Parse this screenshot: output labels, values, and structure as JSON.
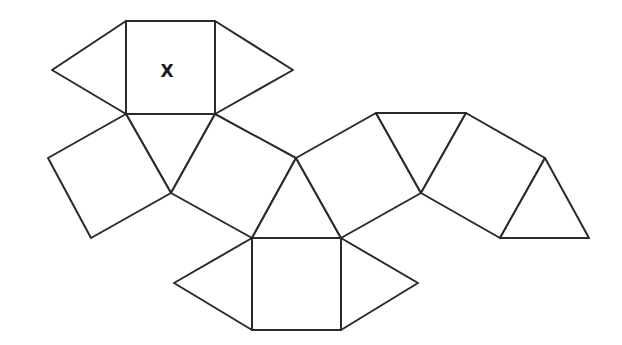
{
  "diagram": {
    "type": "polyhedron-net",
    "stroke_color": "#2a2a2a",
    "background": "#ffffff",
    "label": {
      "text": "X",
      "x": 167,
      "y": 77,
      "face": "top-square"
    },
    "faces": [
      {
        "id": "top-square",
        "shape": "square",
        "points": "126,21 215,21 215,114 126,114"
      },
      {
        "id": "top-left-triangle",
        "shape": "triangle",
        "points": "126,21 52,70 126,114"
      },
      {
        "id": "top-right-triangle",
        "shape": "triangle",
        "points": "215,21 293,70 215,114"
      },
      {
        "id": "upper-center-triangle",
        "shape": "triangle",
        "points": "126,114 215,114 171,193"
      },
      {
        "id": "left-square",
        "shape": "square",
        "points": "126,114 48,158 91,238 171,193"
      },
      {
        "id": "center-square",
        "shape": "square",
        "points": "215,114 296,158 252,238 171,193"
      },
      {
        "id": "middle-triangle",
        "shape": "triangle",
        "points": "296,158 341,238 252,238"
      },
      {
        "id": "bottom-square",
        "shape": "square",
        "points": "252,238 341,238 341,330 252,330"
      },
      {
        "id": "bottom-left-triangle",
        "shape": "triangle",
        "points": "252,238 174,283 252,330"
      },
      {
        "id": "bottom-right-triangle",
        "shape": "triangle",
        "points": "341,238 418,283 341,330"
      },
      {
        "id": "right-square-1",
        "shape": "square",
        "points": "296,158 376,113 421,193 341,238"
      },
      {
        "id": "right-triangle-1",
        "shape": "triangle",
        "points": "376,113 466,113 421,193"
      },
      {
        "id": "right-square-2",
        "shape": "square",
        "points": "466,113 545,158 500,238 421,193"
      },
      {
        "id": "right-triangle-2",
        "shape": "triangle",
        "points": "545,158 589,238 500,238"
      }
    ]
  }
}
